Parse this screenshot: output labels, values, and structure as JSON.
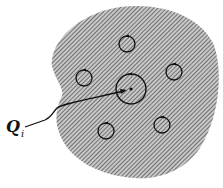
{
  "diagram": {
    "label": {
      "symbol": "Q",
      "subscript": "i"
    },
    "region": {
      "fill_pattern": "diagonal-hatch",
      "hatch_color": "#555555",
      "bg_color": "#bdbdbd"
    },
    "central_loop": {
      "cx": 131,
      "cy": 89,
      "r": 15
    },
    "small_loops": [
      {
        "cx": 127,
        "cy": 44,
        "r": 8
      },
      {
        "cx": 174,
        "cy": 72,
        "r": 8
      },
      {
        "cx": 84,
        "cy": 78,
        "r": 8
      },
      {
        "cx": 106,
        "cy": 131,
        "r": 8
      },
      {
        "cx": 162,
        "cy": 125,
        "r": 8
      }
    ]
  }
}
